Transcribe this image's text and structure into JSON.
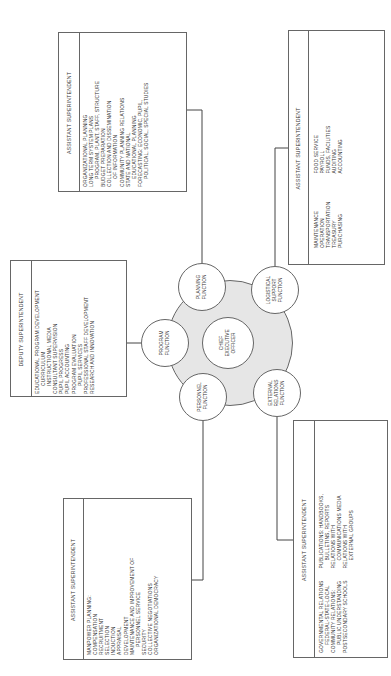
{
  "center": {
    "ceo": {
      "lines": [
        "CHIEF",
        "EXECUTIVE",
        "OFFICER"
      ]
    },
    "functions": {
      "planning": {
        "lines": [
          "PLANNING",
          "FUNCTION"
        ]
      },
      "program": {
        "lines": [
          "PROGRAM",
          "FUNCTION"
        ]
      },
      "personnel": {
        "lines": [
          "PERSONNEL",
          "FUNCTION"
        ]
      },
      "logistical": {
        "lines": [
          "LOGISTICAL",
          "SUPPORT",
          "FUNCTION"
        ]
      },
      "external": {
        "lines": [
          "EXTERNAL",
          "RELATIONS",
          "FUNCTION"
        ]
      }
    },
    "hub_fill": "#e6e6e6"
  },
  "boxes": {
    "planning": {
      "title": "ASSISTANT SUPERINTENDENT",
      "items": [
        "ORGANIZATIONAL PLANNING",
        "LONG TERM SYSTEM PLANS",
        "PROGRAM, PLANT, STAFF, STRUCTURE",
        "BUDGET PREPARATION",
        "COLLECTION AND DISSEMINATION",
        "OF INFORMATION",
        "COMMUNITY PLANNING RELATIONS",
        "STATE AND NATIONAL",
        "EDUCATIONAL PLANNING",
        "FORECASTING: ECONOMIC, PUPIL,",
        "POLITICAL, SOCIAL, SPECIAL STUDIES"
      ]
    },
    "program": {
      "title": "DEPUTY SUPERINTENDENT",
      "items": [
        "EDUCATIONAL PROGRAM DEVELOPMENT",
        "CURRICULUM",
        "INSTRUCTIONAL MEDIA",
        "CONSULTANT SUPERVISION",
        "PUPIL PROGRESS",
        "PUPIL ACCOUNTING",
        "PROGRAM EVALUATION",
        "PUPIL SERVICES",
        "PROFESSIONAL STAFF DEVELOPMENT",
        "RESEARCH AND INNOVATION"
      ]
    },
    "personnel": {
      "title": "ASSISTANT SUPERINTENDENT",
      "items": [
        "MANPOWER PLANNING:",
        "COMPENSATION",
        "RECRUITMENT",
        "SELECTION",
        "INDUCTION",
        "APPRAISAL",
        "DEVELOPMENT",
        "MAINTENANCE AND IMPROVEMENT OF",
        "PERSONNEL SERVICE",
        "SECURITY",
        "COLLECTIVE NEGOTIATIONS",
        "ORGANIZATIONAL DEMOCRACY"
      ]
    },
    "logistical": {
      "title": "ASSISTANT SUPERINTENDENT",
      "col1": [
        "MAINTENANCE",
        "OPERATION",
        "TRANSPORTATION",
        "TREASURY",
        "PURCHASING"
      ],
      "col2": [
        "FOOD SERVICE",
        "PAYROLL",
        "FUNDS, FACILITIES",
        "AUDITING",
        "ACCOUNTING"
      ]
    },
    "external": {
      "title": "ASSISTANT SUPERINTENDENT",
      "col1": [
        "GOVERNMENTAL RELATIONS",
        "FEDERAL-STATE-LOCAL",
        "COMMUNITY RELATIONS:",
        "PUBLIC UNDERSTANDING",
        "POSTSECONDARY SCHOOLS"
      ],
      "col2": [
        "PUBLICATIONS: HANDBOOKS,",
        "BULLETINS, REPORTS",
        "RELATIONS WITH",
        "COMMUNICATIONS MEDIA",
        "RELATIONS WITH",
        "EXTERNAL GROUPS"
      ]
    }
  }
}
